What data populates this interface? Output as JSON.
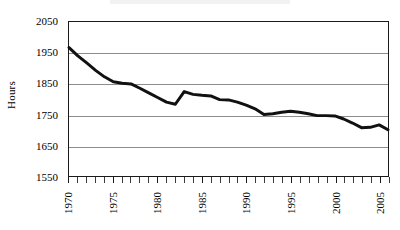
{
  "chart_data": {
    "type": "line",
    "title": "",
    "xlabel": "",
    "ylabel": "Hours",
    "xlim": [
      1970,
      2006
    ],
    "ylim": [
      1550,
      2050
    ],
    "grid": true,
    "legend": "none",
    "y_ticks": [
      2050,
      1950,
      1850,
      1750,
      1650,
      1550
    ],
    "x_ticks": [
      1970,
      1971,
      1972,
      1973,
      1974,
      1975,
      1976,
      1977,
      1978,
      1979,
      1980,
      1981,
      1982,
      1983,
      1984,
      1985,
      1986,
      1987,
      1988,
      1989,
      1990,
      1991,
      1992,
      1993,
      1994,
      1995,
      1996,
      1997,
      1998,
      1999,
      2000,
      2001,
      2002,
      2003,
      2004,
      2005,
      2006
    ],
    "x_tick_labels": [
      "1970",
      "1975",
      "1980",
      "1985",
      "1990",
      "1995",
      "2000",
      "2005"
    ],
    "x_tick_label_values": [
      1970,
      1975,
      1980,
      1985,
      1990,
      1995,
      2000,
      2005
    ],
    "line_color": "#111111",
    "line_width": 3,
    "series": [
      {
        "name": "Annual hours worked",
        "x": [
          1970,
          1971,
          1972,
          1973,
          1974,
          1975,
          1976,
          1977,
          1978,
          1979,
          1980,
          1981,
          1982,
          1983,
          1984,
          1985,
          1986,
          1987,
          1988,
          1989,
          1990,
          1991,
          1992,
          1993,
          1994,
          1995,
          1996,
          1997,
          1998,
          1999,
          2000,
          2001,
          2002,
          2003,
          2004,
          2005,
          2006
        ],
        "values": [
          1967,
          1940,
          1917,
          1893,
          1872,
          1856,
          1851,
          1849,
          1835,
          1820,
          1805,
          1790,
          1783,
          1824,
          1815,
          1812,
          1810,
          1798,
          1797,
          1790,
          1780,
          1768,
          1750,
          1752,
          1757,
          1760,
          1757,
          1752,
          1746,
          1746,
          1745,
          1735,
          1722,
          1707,
          1708,
          1716,
          1700
        ]
      }
    ]
  }
}
